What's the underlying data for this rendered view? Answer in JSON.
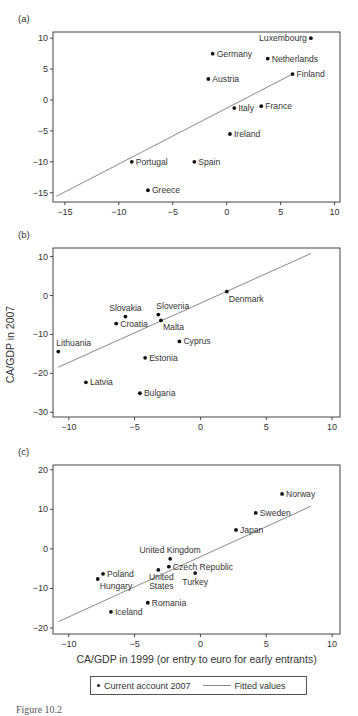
{
  "chart_data": [
    {
      "type": "scatter",
      "panel_label": "(a)",
      "xlim": [
        -16.1,
        10.5
      ],
      "ylim": [
        -16.5,
        11
      ],
      "xticks": [
        -15,
        -10,
        -5,
        0,
        5,
        10
      ],
      "yticks": [
        -15,
        -10,
        -5,
        0,
        5,
        10
      ],
      "frame": {
        "left": 53,
        "right": 340,
        "top": 32,
        "bottom": 202
      },
      "ylabel": "",
      "xlabel": "",
      "points": [
        {
          "label": "Luxembourg",
          "x": 7.8,
          "y": 10.0,
          "label_pos": "left"
        },
        {
          "label": "Germany",
          "x": -1.3,
          "y": 7.5,
          "label_pos": "right"
        },
        {
          "label": "Netherlands",
          "x": 3.8,
          "y": 6.7,
          "label_pos": "right"
        },
        {
          "label": "Finland",
          "x": 6.1,
          "y": 4.2,
          "label_pos": "right"
        },
        {
          "label": "Austria",
          "x": -1.7,
          "y": 3.4,
          "label_pos": "right"
        },
        {
          "label": "Italy",
          "x": 0.7,
          "y": -1.3,
          "label_pos": "right"
        },
        {
          "label": "France",
          "x": 3.2,
          "y": -1.0,
          "label_pos": "right"
        },
        {
          "label": "Ireland",
          "x": 0.3,
          "y": -5.5,
          "label_pos": "right"
        },
        {
          "label": "Portugal",
          "x": -8.8,
          "y": -10.0,
          "label_pos": "right"
        },
        {
          "label": "Spain",
          "x": -3.0,
          "y": -10.0,
          "label_pos": "right"
        },
        {
          "label": "Greece",
          "x": -7.3,
          "y": -14.6,
          "label_pos": "right"
        }
      ],
      "fitted_line": [
        [
          -15.8,
          -15.6
        ],
        [
          6.1,
          4.2
        ]
      ]
    },
    {
      "type": "scatter",
      "panel_label": "(b)",
      "xlim": [
        -11.2,
        10.6
      ],
      "ylim": [
        -31.2,
        12.2
      ],
      "xticks": [
        -10,
        -5,
        0,
        5,
        10
      ],
      "yticks": [
        -30,
        -20,
        -10,
        0,
        10
      ],
      "frame": {
        "left": 53,
        "right": 340,
        "top": 248,
        "bottom": 417
      },
      "ylabel": "CA/GDP in 2007",
      "xlabel": "",
      "points": [
        {
          "label": "Denmark",
          "x": 2.0,
          "y": 1.0,
          "label_pos": "below-right"
        },
        {
          "label": "Slovakia",
          "x": -5.7,
          "y": -5.4,
          "label_pos": "above"
        },
        {
          "label": "Slovenia",
          "x": -3.2,
          "y": -4.9,
          "label_pos": "above-right"
        },
        {
          "label": "Croatia",
          "x": -6.4,
          "y": -7.2,
          "label_pos": "right"
        },
        {
          "label": "Malta",
          "x": -3.0,
          "y": -6.4,
          "label_pos": "below-right"
        },
        {
          "label": "Cyprus",
          "x": -1.6,
          "y": -11.8,
          "label_pos": "right"
        },
        {
          "label": "Lithuania",
          "x": -10.8,
          "y": -14.4,
          "label_pos": "above-right"
        },
        {
          "label": "Estonia",
          "x": -4.2,
          "y": -16.0,
          "label_pos": "right"
        },
        {
          "label": "Latvia",
          "x": -8.7,
          "y": -22.3,
          "label_pos": "right"
        },
        {
          "label": "Bulgaria",
          "x": -4.6,
          "y": -25.1,
          "label_pos": "right"
        }
      ],
      "fitted_line": [
        [
          -10.8,
          -18.4
        ],
        [
          8.4,
          10.8
        ]
      ]
    },
    {
      "type": "scatter",
      "panel_label": "(c)",
      "xlim": [
        -11.2,
        10.6
      ],
      "ylim": [
        -21.5,
        21.2
      ],
      "xticks": [
        -10,
        -5,
        0,
        5,
        10
      ],
      "yticks": [
        -20,
        -10,
        0,
        10,
        20
      ],
      "frame": {
        "left": 53,
        "right": 340,
        "top": 465,
        "bottom": 634
      },
      "ylabel": "",
      "xlabel": "CA/GDP in 1999 (or entry to euro for early entrants)",
      "points": [
        {
          "label": "Norway",
          "x": 6.2,
          "y": 13.9,
          "label_pos": "right"
        },
        {
          "label": "Sweden",
          "x": 4.2,
          "y": 9.1,
          "label_pos": "right"
        },
        {
          "label": "Japan",
          "x": 2.7,
          "y": 4.8,
          "label_pos": "right"
        },
        {
          "label": "United Kingdom",
          "x": -2.3,
          "y": -2.5,
          "label_pos": "above-left"
        },
        {
          "label": "Czech Republic",
          "x": -2.4,
          "y": -4.5,
          "label_pos": "right"
        },
        {
          "label": "United States",
          "x": -3.2,
          "y": -5.3,
          "label_pos": "below-twoline"
        },
        {
          "label": "Turkey",
          "x": -0.4,
          "y": -6.1,
          "label_pos": "below"
        },
        {
          "label": "Poland",
          "x": -7.4,
          "y": -6.3,
          "label_pos": "right"
        },
        {
          "label": "Hungary",
          "x": -7.8,
          "y": -7.6,
          "label_pos": "below-right"
        },
        {
          "label": "Romania",
          "x": -4.0,
          "y": -13.6,
          "label_pos": "right"
        },
        {
          "label": "Iceland",
          "x": -6.8,
          "y": -15.9,
          "label_pos": "right"
        }
      ],
      "fitted_line": [
        [
          -10.8,
          -18.4
        ],
        [
          8.4,
          10.8
        ]
      ]
    }
  ],
  "legend": {
    "points_label": "Current account 2007",
    "line_label": "Fitted values"
  },
  "caption": "Figure 10.2"
}
